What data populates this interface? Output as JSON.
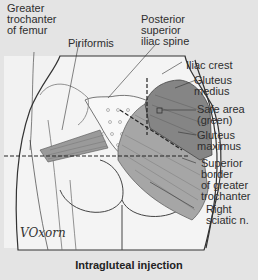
{
  "figure": {
    "caption": "Intragluteal injection",
    "signature": "VOxorn",
    "labels": {
      "greater_trochanter": "Greater\ntrochanter\nof femur",
      "piriformis": "Piriformis",
      "psis": "Posterior\nsuperior\niliac spine",
      "iliac_crest": "Iliac crest",
      "gluteus_medius": "Gluteus\nmedius",
      "safe_area": "Safe area\n(green)",
      "gluteus_maximus": "Gluteus\nmaximus",
      "superior_border": "Superior\nborder\nof greater\ntrochanter",
      "sciatic": "Right\nsciatic n."
    },
    "colors": {
      "background": "#e4e4e4",
      "skin": "#f2f2f2",
      "muscle": "#8a8a8a",
      "safe_area": "#6e6e6e",
      "outline": "#333333"
    }
  }
}
